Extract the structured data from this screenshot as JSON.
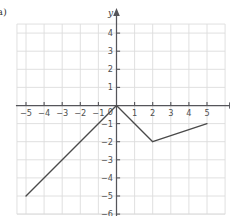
{
  "part_label": "a)",
  "chart_data": {
    "type": "line",
    "title": "",
    "xlabel": "x",
    "ylabel": "y",
    "xlim": [
      -5.8,
      6.0
    ],
    "ylim": [
      -6.3,
      4.8
    ],
    "grid": true,
    "grid_color": "#dcdcdc",
    "axis_color": "#55555a",
    "line_color": "#4a4a4a",
    "legend": "none",
    "xticks": [
      -5,
      -4,
      -3,
      -2,
      -1,
      1,
      2,
      3,
      4,
      5
    ],
    "xtick_labels": [
      "−5",
      "−4",
      "−3",
      "−2",
      "−1",
      "1",
      "2",
      "3",
      "4",
      "5"
    ],
    "yticks": [
      4,
      3,
      2,
      1,
      -1,
      -2,
      -3,
      -4,
      -5,
      -6
    ],
    "ytick_labels": [
      "4",
      "3",
      "2",
      "1",
      "−1",
      "−2",
      "−3",
      "−4",
      "−5",
      "−6"
    ],
    "origin_label": "0",
    "series": [
      {
        "name": "piecewise-linear",
        "points": [
          {
            "x": -5,
            "y": -5
          },
          {
            "x": 0,
            "y": 0
          },
          {
            "x": 2,
            "y": -2
          },
          {
            "x": 5,
            "y": -1
          }
        ]
      }
    ]
  }
}
